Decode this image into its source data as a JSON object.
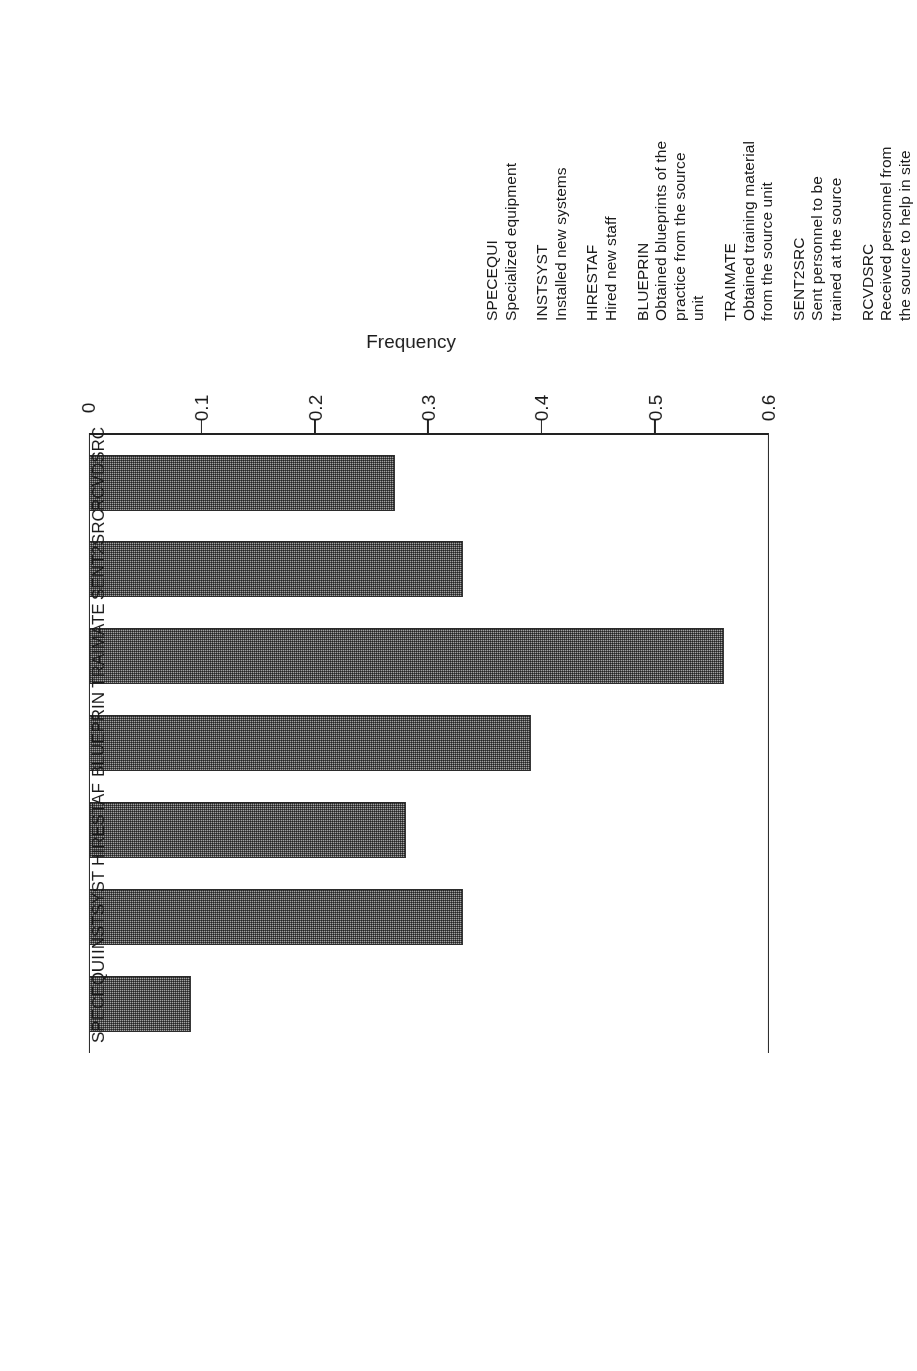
{
  "figure": {
    "rotation_note": "figure printed upside-down (180 degrees)",
    "value_axis_title": "Frequency"
  },
  "chart_data": {
    "type": "bar",
    "orientation": "horizontal",
    "title": "",
    "xlabel": "",
    "ylabel": "Frequency",
    "ylim": [
      0,
      0.6
    ],
    "grid": false,
    "legend_position": "below-plot",
    "tick_labels": [
      "0",
      "0.1",
      "0.2",
      "0.3",
      "0.4",
      "0.5",
      "0.6"
    ],
    "tick_values": [
      0,
      0.1,
      0.2,
      0.3,
      0.4,
      0.5,
      0.6
    ],
    "categories": [
      "SPECEQUI",
      "INSTSYST",
      "HIRESTAF",
      "BLUEPRIN",
      "TRAIMATE",
      "SENT2SRC",
      "RCVDSRC"
    ],
    "values": [
      0.09,
      0.33,
      0.28,
      0.39,
      0.56,
      0.33,
      0.27
    ],
    "bar_fill": "#a8a8a8",
    "bar_edge": "#2b2b2b"
  },
  "legend": {
    "entries": [
      {
        "code": "SPECEQUI",
        "description": "Specialized equipment"
      },
      {
        "code": "INSTSYST",
        "description": "Installed new systems"
      },
      {
        "code": "HIRESTAF",
        "description": "Hired new staff"
      },
      {
        "code": "BLUEPRIN",
        "description": "Obtained blueprints of the\npractice from the source\nunit"
      },
      {
        "code": "TRAIMATE",
        "description": "Obtained training material\nfrom the source unit"
      },
      {
        "code": "SENT2SRC",
        "description": "Sent personnel to be\ntrained at the source"
      },
      {
        "code": "RCVDSRC",
        "description": "Received personnel from\nthe source to help in site"
      }
    ]
  }
}
